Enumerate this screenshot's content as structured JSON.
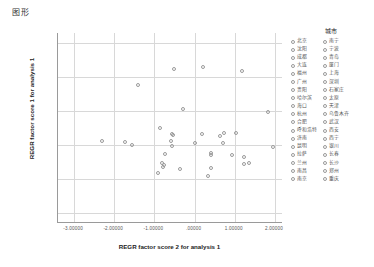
{
  "window": {
    "title": "图形"
  },
  "chart_data": {
    "type": "scatter",
    "title": "图形",
    "xlabel": "REGR factor score  2 for analysis 1",
    "ylabel": "REGR factor score  1 for analysis 1",
    "xlim": [
      -3.4,
      2.2
    ],
    "ylim": [
      -2.3,
      3.3
    ],
    "grid": true,
    "xticks": [
      "-3.00000",
      "-2.00000",
      "-1.00000",
      ".00000",
      "1.00000",
      "2.00000"
    ],
    "xtick_values": [
      -3,
      -2,
      -1,
      0,
      1,
      2
    ],
    "yticks": [
      "3.00000",
      "2.00000",
      "1.00000",
      ".00000",
      "-1.00000",
      "-2.00000"
    ],
    "ytick_values": [
      3,
      2,
      1,
      0,
      -1,
      -2
    ],
    "legend_position": "right",
    "legend_title": "城市",
    "series_name": "城市",
    "points": [
      {
        "label": "北京",
        "x": -0.52,
        "y": 2.25
      },
      {
        "label": "上海",
        "x": 0.22,
        "y": 2.3
      },
      {
        "label": "广州",
        "x": 1.18,
        "y": 2.18
      },
      {
        "label": "深圳",
        "x": -1.42,
        "y": 1.76
      },
      {
        "label": "天津",
        "x": -0.28,
        "y": 1.07
      },
      {
        "label": "重庆",
        "x": 1.83,
        "y": 0.96
      },
      {
        "label": "杭州",
        "x": -0.86,
        "y": 0.5
      },
      {
        "label": "南京",
        "x": -0.57,
        "y": 0.33
      },
      {
        "label": "武汉",
        "x": -0.55,
        "y": 0.3
      },
      {
        "label": "成都",
        "x": 0.19,
        "y": 0.32
      },
      {
        "label": "西安",
        "x": 0.72,
        "y": 0.34
      },
      {
        "label": "沈阳",
        "x": 0.62,
        "y": 0.27
      },
      {
        "label": "青岛",
        "x": 1.02,
        "y": 0.36
      },
      {
        "label": "大连",
        "x": -2.3,
        "y": 0.12
      },
      {
        "label": "厦门",
        "x": -1.73,
        "y": 0.09
      },
      {
        "label": "福州",
        "x": -1.55,
        "y": 0.01
      },
      {
        "label": "济南",
        "x": -0.58,
        "y": 0.12
      },
      {
        "label": "长沙",
        "x": -0.57,
        "y": -0.02
      },
      {
        "label": "郑州",
        "x": 0.0,
        "y": 0.05
      },
      {
        "label": "合肥",
        "x": 0.7,
        "y": 0.05
      },
      {
        "label": "昆明",
        "x": 1.95,
        "y": -0.06
      },
      {
        "label": "哈尔滨",
        "x": -0.74,
        "y": -0.27
      },
      {
        "label": "长春",
        "x": 0.42,
        "y": -0.25
      },
      {
        "label": "石家庄",
        "x": 0.41,
        "y": -0.3
      },
      {
        "label": "太原",
        "x": 0.93,
        "y": -0.3
      },
      {
        "label": "南昌",
        "x": 1.22,
        "y": -0.35
      },
      {
        "label": "南宁",
        "x": -0.8,
        "y": -0.53
      },
      {
        "label": "贵阳",
        "x": -0.77,
        "y": -0.6
      },
      {
        "label": "兰州",
        "x": 1.22,
        "y": -0.55
      },
      {
        "label": "乌鲁木齐",
        "x": 1.35,
        "y": -0.53
      },
      {
        "label": "银川",
        "x": -0.37,
        "y": -0.7
      },
      {
        "label": "西宁",
        "x": 0.4,
        "y": -0.68
      },
      {
        "label": "海口",
        "x": -0.78,
        "y": -0.65
      },
      {
        "label": "呼和浩特",
        "x": -0.92,
        "y": -0.82
      },
      {
        "label": "拉萨",
        "x": 0.33,
        "y": -0.9
      }
    ]
  },
  "legend": {
    "title": "城市",
    "column_left": [
      "北京",
      "沈阳",
      "成都",
      "大连",
      "福州",
      "广州",
      "贵阳",
      "哈尔滨",
      "海口",
      "杭州",
      "合肥",
      "呼和浩特",
      "济南",
      "昆明",
      "拉萨",
      "兰州",
      "南昌",
      "南京"
    ],
    "column_right": [
      "南宁",
      "宁波",
      "青岛",
      "厦门",
      "上海",
      "深圳",
      "石家庄",
      "太原",
      "天津",
      "乌鲁木齐",
      "武汉",
      "西安",
      "西宁",
      "银川",
      "长春",
      "长沙",
      "郑州",
      "重庆"
    ]
  }
}
